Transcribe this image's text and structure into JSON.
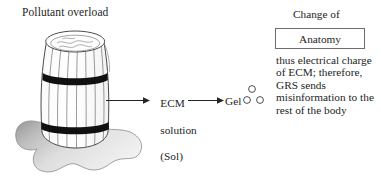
{
  "diagram": {
    "title_label": "Pollutant overload",
    "stage_one": {
      "line1": "ECM",
      "line2": "solution",
      "line3": "(Sol)"
    },
    "stage_two": {
      "label": "Gel"
    },
    "outcome": {
      "caption": "Change of",
      "box_label": "Anatomy",
      "explanation": "thus electrical charge of ECM; therefore, GRS sends misinformation to the rest of the body"
    },
    "icons": {
      "barrel": "leaking-barrel-icon",
      "spill": "liquid-spill-icon",
      "arrow": "right-arrow-icon",
      "particle": "gel-particle-icon"
    },
    "colors": {
      "ink": "#242424",
      "outline": "#4a4a4a",
      "band": "#111111",
      "spill_dark": "#8f8f8f",
      "spill_light": "#e9e9e9",
      "box_border": "#6d6d6d",
      "background": "#ffffff"
    }
  }
}
